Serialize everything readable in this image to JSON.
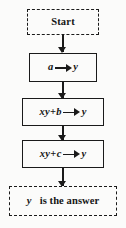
{
  "diagram": {
    "background_color": "#fbfbfa",
    "line_color": "#1a1a1a",
    "nodes": [
      {
        "id": "start",
        "shape": "dashed-rect",
        "label": "Start",
        "kind": "terminal"
      },
      {
        "id": "assign-a",
        "shape": "solid-rect",
        "kind": "process",
        "label": "a ⟶ y",
        "lhs": "a",
        "arrow": "rightwards-arrow",
        "rhs": "y"
      },
      {
        "id": "assign-xy-plus-b",
        "shape": "solid-rect",
        "kind": "process",
        "label": "xy+b ⟶ y",
        "lhs_var1": "xy",
        "lhs_op": "+",
        "lhs_var2": "b",
        "arrow": "rightwards-arrow",
        "rhs": "y"
      },
      {
        "id": "assign-xy-plus-c",
        "shape": "solid-rect",
        "kind": "process",
        "label": "xy+c ⟶ y",
        "lhs_var1": "xy",
        "lhs_op": "+",
        "lhs_var2": "c",
        "arrow": "rightwards-arrow",
        "rhs": "y"
      },
      {
        "id": "answer",
        "shape": "dashed-rect",
        "kind": "terminal",
        "label": "y is the answer",
        "subject": "y",
        "predicate": "is the answer"
      }
    ],
    "connectors": [
      {
        "from": "start",
        "to": "assign-a",
        "style": "solid-down-arrow"
      },
      {
        "from": "assign-a",
        "to": "assign-xy-plus-b",
        "style": "solid-down-arrow"
      },
      {
        "from": "assign-xy-plus-b",
        "to": "assign-xy-plus-c",
        "style": "solid-down-arrow"
      },
      {
        "from": "assign-xy-plus-c",
        "to": "answer",
        "style": "solid-down-arrow"
      }
    ]
  }
}
